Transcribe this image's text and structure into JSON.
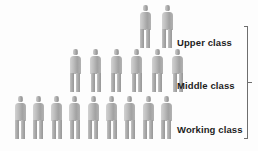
{
  "chart_data": {
    "type": "pictogram",
    "title": "",
    "unit": "person figure",
    "categories": [
      "Upper class",
      "Middle class",
      "Working class"
    ],
    "values": [
      2,
      6,
      9
    ],
    "orientation": "rows-stacked-pyramid",
    "legend": "none",
    "grid": false,
    "colors": {
      "figure_light": "#d2d2d2",
      "figure_mid": "#b4b4b4",
      "figure_dark": "#979797",
      "label_text": "#1d1d1d",
      "bracket": "#6e6e6e",
      "background": "#fdfdfd"
    },
    "rows": [
      {
        "label": "Upper class",
        "count": 2,
        "row_index": 0,
        "label_x": 177,
        "label_y": 37,
        "figure_top": 5,
        "figure_start_x": 138,
        "figure_step": 22
      },
      {
        "label": "Middle class",
        "count": 6,
        "row_index": 1,
        "label_x": 177,
        "label_y": 80,
        "figure_top": 49,
        "figure_start_x": 68,
        "figure_step": 20.5
      },
      {
        "label": "Working class",
        "count": 9,
        "row_index": 2,
        "label_x": 177,
        "label_y": 124,
        "figure_top": 96,
        "figure_start_x": 13,
        "figure_step": 18.3
      }
    ]
  },
  "bracket": {
    "present": true,
    "style": "vertical-line-with-center-tick",
    "spans_rows": [
      "Upper class",
      "Middle class",
      "Working class"
    ]
  }
}
